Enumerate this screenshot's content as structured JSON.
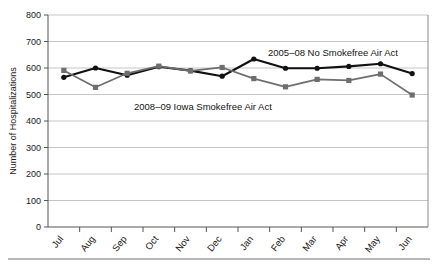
{
  "chart_data": {
    "type": "line",
    "title": "",
    "xlabel": "",
    "ylabel": "Number of Hospitalizations",
    "categories": [
      "Jul",
      "Aug",
      "Sep",
      "Oct",
      "Nov",
      "Dec",
      "Jan",
      "Feb",
      "Mar",
      "Apr",
      "May",
      "Jun"
    ],
    "ylim": [
      0,
      800
    ],
    "ytick_values": [
      0,
      100,
      200,
      300,
      400,
      500,
      600,
      700,
      800
    ],
    "ytick_labels": [
      "0",
      "100",
      "200",
      "300",
      "400",
      "500",
      "600",
      "700",
      "800"
    ],
    "grid": true,
    "grid_axis": "y",
    "legend_position": "inline-annotations",
    "series": [
      {
        "name": "2005–08 No Smokefree Air Act",
        "color": "#111111",
        "marker": "circle",
        "values": [
          565,
          600,
          573,
          605,
          590,
          569,
          634,
          599,
          599,
          606,
          616,
          579
        ]
      },
      {
        "name": "2008–09 Iowa Smokefree Air Act",
        "color": "#6e6e6e",
        "marker": "square",
        "values": [
          591,
          527,
          580,
          607,
          589,
          602,
          560,
          529,
          557,
          553,
          577,
          498
        ]
      }
    ],
    "annotations": [
      {
        "name": "series-label-no-smokefree",
        "text": "2005–08 No Smokefree Air Act",
        "x_px": 268,
        "y_px": 56
      },
      {
        "name": "series-label-iowa-smokefree",
        "text": "2008–09 Iowa Smokefree Air Act",
        "x_px": 134,
        "y_px": 110
      }
    ]
  },
  "axes": {
    "y_axis_title": "Number of Hospitalizations"
  },
  "colors": {
    "series_dark": "#111111",
    "series_gray": "#6e6e6e",
    "gridline": "#b6b6b6",
    "axis": "#555555",
    "rule": "#6f6f6f",
    "background": "#ffffff"
  }
}
